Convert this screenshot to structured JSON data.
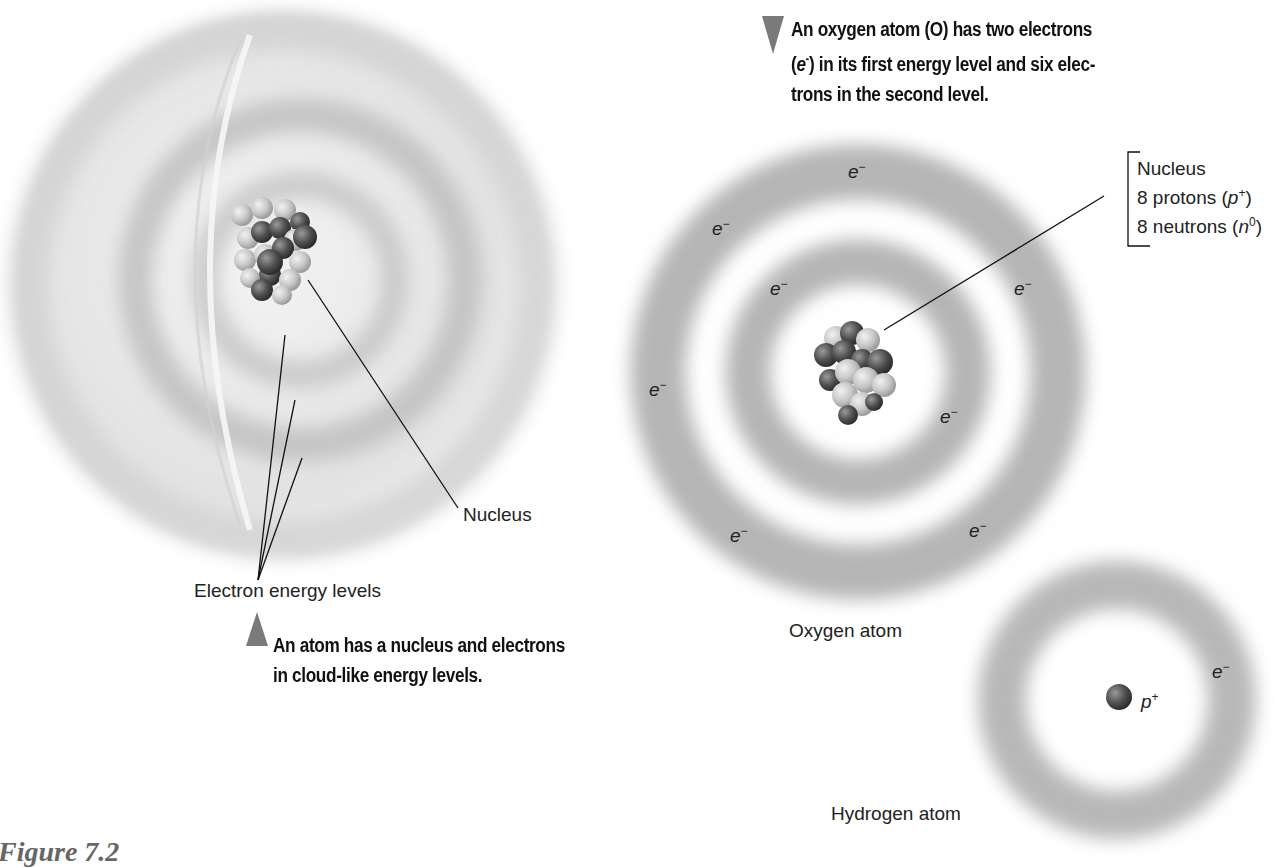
{
  "figure_number": "Figure 7.2",
  "cutaway_atom": {
    "caption": "An atom has a nucleus and electrons in cloud-like energy levels.",
    "caption_line1": "An atom has a nucleus and electrons",
    "caption_line2": "in cloud-like energy levels.",
    "nucleus_label": "Nucleus",
    "energy_levels_label": "Electron energy levels"
  },
  "oxygen_atom": {
    "caption": "An oxygen atom (O) has two electrons (e-) in its first energy level and six electrons in the second level.",
    "caption_line1": "An oxygen atom (O) has two electrons",
    "caption_line2_pre": "(",
    "caption_line2_e": "e",
    "caption_line2_sup": "-",
    "caption_line2_post": ") in its first energy level and six elec-",
    "caption_line3": "trons in the second level.",
    "title": "Oxygen atom",
    "nucleus_box": {
      "title": "Nucleus",
      "protons": "8 protons (",
      "protons_symbol": "p",
      "protons_sup": "+",
      "neutrons": "8 neutrons (",
      "neutrons_symbol": "n",
      "neutrons_sup": "0",
      "close": ")"
    },
    "electron_symbol": "e",
    "electron_sup": "−",
    "electron_count": 8,
    "first_level_electrons": 2,
    "second_level_electrons": 6
  },
  "hydrogen_atom": {
    "title": "Hydrogen atom",
    "proton_symbol": "p",
    "proton_sup": "+",
    "electron_symbol": "e",
    "electron_sup": "−"
  },
  "colors": {
    "cloud": "#9a9a9a",
    "arrow": "#7a7a7a",
    "proton_dark": "#4a4a4a",
    "neutron_light": "#cfcfcf",
    "figure_label": "#666666"
  }
}
